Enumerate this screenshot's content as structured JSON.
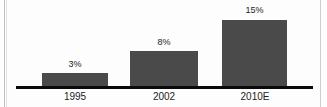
{
  "chart_data": {
    "type": "bar",
    "title": "",
    "subtitle": "",
    "xlabel": "",
    "ylabel": "",
    "categories": [
      "1995",
      "2002",
      "2010E"
    ],
    "values": [
      3,
      8,
      15
    ],
    "value_labels": [
      "3%",
      "8%",
      "15%"
    ],
    "unit": "%",
    "ylim": [
      0,
      15
    ],
    "grid": false,
    "legend": null,
    "series": [
      {
        "name": "Share",
        "values": [
          3,
          8,
          15
        ]
      }
    ],
    "annotations": []
  },
  "style": {
    "bar_color": "#4a4a4a",
    "axis_color": "#0a0a0a",
    "text_color": "#1c1c1c",
    "background": "#fdfdfd",
    "edge_rule_color": "#c9c9c9"
  },
  "geometry": {
    "baseline_y": 86,
    "baseline_left": 16,
    "baseline_width": 297,
    "baseline_height": 3,
    "px_per_unit": 4.4,
    "bars": [
      {
        "left": 42,
        "width": 66,
        "top": 73,
        "height": 13
      },
      {
        "left": 130,
        "width": 68,
        "top": 51,
        "height": 35
      },
      {
        "left": 222,
        "width": 65,
        "top": 20,
        "height": 66
      }
    ],
    "value_label_positions": [
      {
        "left": 42,
        "width": 66,
        "top": 59
      },
      {
        "left": 130,
        "width": 68,
        "top": 37
      },
      {
        "left": 222,
        "width": 65,
        "top": 5
      }
    ],
    "category_label_positions": [
      {
        "left": 42,
        "width": 66,
        "top": 91
      },
      {
        "left": 130,
        "width": 68,
        "top": 91
      },
      {
        "left": 220,
        "width": 70,
        "top": 91
      }
    ]
  }
}
